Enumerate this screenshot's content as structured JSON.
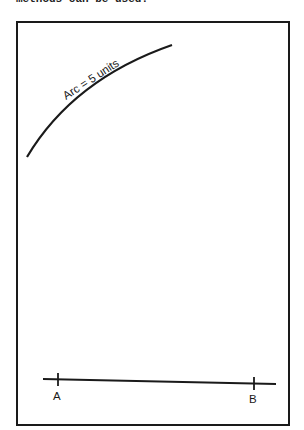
{
  "caption": {
    "top_text": "methods can be used."
  },
  "diagram": {
    "arc_label": "Arc = 5 units",
    "points": [
      {
        "label": "A"
      },
      {
        "label": "B"
      }
    ],
    "stroke_color": "#1a1a1a"
  }
}
